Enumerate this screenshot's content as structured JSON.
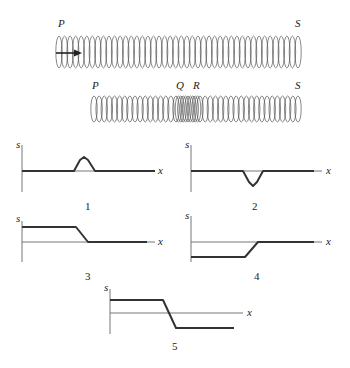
{
  "springs": [
    {
      "id": "spring-uncompressed",
      "x0": 56,
      "x1": 301,
      "top": 36,
      "bottom": 68,
      "coils": 44,
      "labels": [
        {
          "text": "P",
          "x": 58,
          "y": 27
        },
        {
          "text": "S",
          "x": 295,
          "y": 27
        }
      ],
      "arrow": {
        "x0": 56,
        "x1": 82,
        "y": 53,
        "color": "#222222"
      }
    },
    {
      "id": "spring-compressed",
      "x0": 91,
      "x1": 301,
      "top": 96,
      "bottom": 122,
      "coils": 36,
      "compressed": {
        "from": 176,
        "to": 200,
        "coils": 10
      },
      "labels": [
        {
          "text": "P",
          "x": 92,
          "y": 89
        },
        {
          "text": "Q",
          "x": 176,
          "y": 89
        },
        {
          "text": "R",
          "x": 193,
          "y": 89
        },
        {
          "text": "S",
          "x": 295,
          "y": 89
        }
      ]
    }
  ],
  "chart_data": [
    {
      "type": "line",
      "title": "1",
      "xlabel": "x",
      "ylabel": "s",
      "description": "Displacement zero everywhere except a positive bump (pulse) centered mid-axis",
      "origin": {
        "x": 22,
        "y": 171
      },
      "axis": {
        "ytop": 145,
        "ybottom": 192,
        "xend": 155
      },
      "points": [
        [
          22,
          171
        ],
        [
          74,
          171
        ],
        [
          80,
          160
        ],
        [
          84,
          157
        ],
        [
          88,
          160
        ],
        [
          95,
          171
        ],
        [
          155,
          171
        ]
      ],
      "line_color": "#7a5a8a",
      "label_pos": {
        "s": [
          16,
          148
        ],
        "x": [
          158,
          174
        ],
        "num": [
          85,
          210
        ]
      }
    },
    {
      "type": "line",
      "title": "2",
      "xlabel": "x",
      "ylabel": "s",
      "description": "Displacement zero everywhere except a negative dip (pulse) mid-axis",
      "origin": {
        "x": 191,
        "y": 171
      },
      "axis": {
        "ytop": 145,
        "ybottom": 192,
        "xend": 322
      },
      "points": [
        [
          191,
          171
        ],
        [
          243,
          171
        ],
        [
          249,
          182
        ],
        [
          253,
          186
        ],
        [
          257,
          182
        ],
        [
          263,
          171
        ],
        [
          314,
          171
        ]
      ],
      "line_color": "#5a4a3a",
      "label_pos": {
        "s": [
          185,
          148
        ],
        "x": [
          326,
          174
        ],
        "num": [
          252,
          210
        ]
      }
    },
    {
      "type": "line",
      "title": "3",
      "xlabel": "x",
      "ylabel": "s",
      "description": "Constant positive displacement on the left, ramps down to zero, then zero on the right",
      "origin": {
        "x": 22,
        "y": 242
      },
      "axis": {
        "ytop": 221,
        "ybottom": 262,
        "xend": 155
      },
      "points": [
        [
          22,
          227
        ],
        [
          76,
          227
        ],
        [
          88,
          242
        ],
        [
          147,
          242
        ]
      ],
      "line_color": "#333333",
      "label_pos": {
        "s": [
          16,
          222
        ],
        "x": [
          158,
          245
        ],
        "num": [
          85,
          280
        ]
      }
    },
    {
      "type": "line",
      "title": "4",
      "xlabel": "x",
      "ylabel": "s",
      "description": "Constant negative displacement on the left, ramps up to zero, then zero on the right",
      "origin": {
        "x": 191,
        "y": 242
      },
      "axis": {
        "ytop": 216,
        "ybottom": 262,
        "xend": 322
      },
      "points": [
        [
          191,
          257
        ],
        [
          245,
          257
        ],
        [
          258,
          242
        ],
        [
          314,
          242
        ]
      ],
      "line_color": "#333333",
      "label_pos": {
        "s": [
          185,
          219
        ],
        "x": [
          326,
          245
        ],
        "num": [
          254,
          280
        ]
      }
    },
    {
      "type": "line",
      "title": "5",
      "xlabel": "x",
      "ylabel": "s",
      "description": "Constant positive displacement on the left, ramps down through zero to constant negative displacement on the right",
      "origin": {
        "x": 110,
        "y": 313
      },
      "axis": {
        "ytop": 289,
        "ybottom": 334,
        "xend": 243
      },
      "points": [
        [
          110,
          300
        ],
        [
          163,
          300
        ],
        [
          176,
          328
        ],
        [
          234,
          328
        ]
      ],
      "line_color": "#333333",
      "label_pos": {
        "s": [
          104,
          291
        ],
        "x": [
          247,
          316
        ],
        "num": [
          172,
          350
        ]
      }
    }
  ]
}
